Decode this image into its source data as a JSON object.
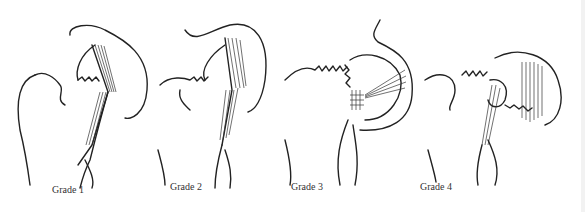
{
  "figure": {
    "panels": [
      {
        "id": 1,
        "label": "Grade 1"
      },
      {
        "id": 2,
        "label": "Grade 2"
      },
      {
        "id": 3,
        "label": "Grade 3"
      },
      {
        "id": 4,
        "label": "Grade 4"
      }
    ]
  }
}
